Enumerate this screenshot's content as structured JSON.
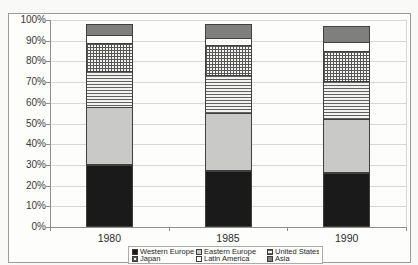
{
  "chart_data": {
    "type": "bar",
    "stacked": true,
    "percent_stacked": true,
    "title": "",
    "xlabel": "",
    "ylabel": "",
    "categories": [
      "1980",
      "1985",
      "1990"
    ],
    "series": [
      {
        "name": "Western Europe",
        "pattern": "solid-black",
        "color": "#1a1a1a",
        "values": [
          30,
          27,
          26
        ]
      },
      {
        "name": "Eastern Europe",
        "pattern": "solid-lightgray",
        "color": "#c9c9c8",
        "values": [
          28,
          28,
          26
        ]
      },
      {
        "name": "United States",
        "pattern": "horizontal-lines",
        "color": "#616161",
        "values": [
          18,
          19,
          19
        ]
      },
      {
        "name": "Japan",
        "pattern": "grid",
        "color": "#565656",
        "values": [
          14,
          15,
          15
        ]
      },
      {
        "name": "Latin America",
        "pattern": "solid-white",
        "color": "#fcfcfb",
        "values": [
          4,
          4,
          5
        ]
      },
      {
        "name": "Asia",
        "pattern": "solid-gray",
        "color": "#7f7f7e",
        "values": [
          6,
          7,
          8
        ]
      }
    ],
    "ylim": [
      0,
      100
    ],
    "ytick_step": 10,
    "ytick_labels": [
      "0%",
      "10%",
      "20%",
      "30%",
      "40%",
      "50%",
      "60%",
      "70%",
      "80%",
      "90%",
      "100%"
    ],
    "grid": true,
    "legend_position": "bottom",
    "colors": {
      "frame_border": "#9c9c9c",
      "axis": "#8f8f8d",
      "gridline": "#d7d7d5",
      "segment_outline": "#404040",
      "text": "#2c2c2c",
      "background": "#f9f9f8"
    }
  }
}
